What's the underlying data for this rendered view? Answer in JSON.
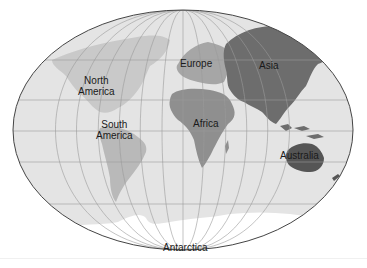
{
  "map": {
    "projection": "world-ellipse",
    "colors": {
      "ocean": "#e4e4e4",
      "outline": "#444444",
      "graticule": "#9a9a9a",
      "north_america": "#c9c9c9",
      "south_america": "#b9b9b9",
      "europe": "#a6a6a6",
      "africa": "#8f8f8f",
      "asia": "#6d6d6d",
      "australia": "#555555",
      "antarctica": "#ffffff"
    },
    "labels": {
      "north_america": {
        "line1": "North",
        "line2": "America"
      },
      "south_america": {
        "line1": "South",
        "line2": "America"
      },
      "europe": "Europe",
      "africa": "Africa",
      "asia": "Asia",
      "australia": "Australia",
      "antarctica": "Antarctica"
    }
  }
}
